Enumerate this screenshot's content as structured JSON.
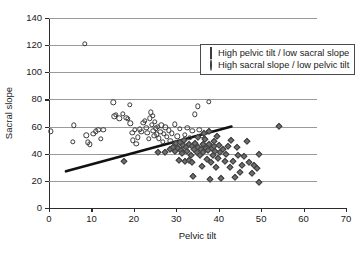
{
  "chart_data": {
    "type": "scatter",
    "title": "",
    "xlabel": "Pelvic tilt",
    "ylabel": "Sacral slope",
    "xlim": [
      0,
      70
    ],
    "ylim": [
      0,
      140
    ],
    "xticks": [
      0,
      10,
      20,
      30,
      40,
      50,
      60,
      70
    ],
    "yticks": [
      0,
      20,
      40,
      60,
      80,
      100,
      120,
      140
    ],
    "grid": "horizontal",
    "legend_position": "upper-center-right-inside",
    "series": [
      {
        "name": "High pelvic tilt / low sacral slope",
        "marker": "filled-diamond",
        "color": "#6e6e6e",
        "points": [
          [
            17.6,
            34.8
          ],
          [
            25.8,
            41.2
          ],
          [
            27.4,
            41.0
          ],
          [
            28.6,
            43.6
          ],
          [
            29.2,
            45.0
          ],
          [
            29.6,
            41.8
          ],
          [
            30.0,
            47.8
          ],
          [
            30.3,
            44.2
          ],
          [
            30.6,
            35.6
          ],
          [
            30.9,
            48.6
          ],
          [
            31.2,
            43.0
          ],
          [
            31.4,
            40.6
          ],
          [
            31.6,
            46.4
          ],
          [
            31.8,
            50.4
          ],
          [
            32.0,
            34.6
          ],
          [
            32.3,
            44.8
          ],
          [
            32.6,
            42.2
          ],
          [
            32.9,
            47.0
          ],
          [
            33.1,
            35.2
          ],
          [
            33.4,
            39.4
          ],
          [
            33.6,
            45.6
          ],
          [
            33.8,
            34.2
          ],
          [
            34.0,
            23.6
          ],
          [
            34.2,
            43.4
          ],
          [
            34.5,
            48.0
          ],
          [
            34.8,
            41.6
          ],
          [
            35.0,
            52.2
          ],
          [
            35.2,
            45.2
          ],
          [
            35.5,
            38.8
          ],
          [
            35.8,
            43.8
          ],
          [
            36.0,
            30.8
          ],
          [
            36.2,
            46.8
          ],
          [
            36.4,
            41.0
          ],
          [
            36.6,
            55.6
          ],
          [
            36.8,
            50.8
          ],
          [
            37.0,
            44.4
          ],
          [
            37.2,
            36.2
          ],
          [
            37.4,
            42.6
          ],
          [
            37.6,
            56.4
          ],
          [
            37.8,
            47.4
          ],
          [
            38.0,
            21.2
          ],
          [
            38.2,
            34.0
          ],
          [
            38.4,
            44.0
          ],
          [
            38.6,
            39.0
          ],
          [
            38.8,
            49.6
          ],
          [
            39.0,
            45.8
          ],
          [
            39.2,
            42.0
          ],
          [
            39.4,
            30.4
          ],
          [
            39.6,
            53.4
          ],
          [
            39.8,
            36.6
          ],
          [
            40.0,
            46.2
          ],
          [
            40.3,
            41.4
          ],
          [
            40.6,
            22.2
          ],
          [
            41.0,
            43.2
          ],
          [
            41.4,
            34.4
          ],
          [
            41.8,
            39.8
          ],
          [
            42.2,
            45.4
          ],
          [
            42.6,
            30.2
          ],
          [
            43.0,
            50.2
          ],
          [
            43.4,
            35.0
          ],
          [
            43.8,
            22.8
          ],
          [
            44.2,
            44.6
          ],
          [
            44.6,
            39.2
          ],
          [
            45.0,
            26.4
          ],
          [
            45.4,
            31.6
          ],
          [
            46.0,
            38.6
          ],
          [
            46.6,
            49.2
          ],
          [
            47.2,
            33.8
          ],
          [
            47.8,
            25.6
          ],
          [
            48.4,
            31.8
          ],
          [
            49.0,
            29.2
          ],
          [
            49.4,
            39.8
          ],
          [
            49.6,
            18.8
          ],
          [
            54.2,
            60.2
          ]
        ]
      },
      {
        "name": "High sacral slope / low pelvic tilt",
        "marker": "open-circle",
        "color": "#3a3a3a",
        "points": [
          [
            0.4,
            56.6
          ],
          [
            5.6,
            49.0
          ],
          [
            5.8,
            60.8
          ],
          [
            8.4,
            121.2
          ],
          [
            8.8,
            53.6
          ],
          [
            9.2,
            48.4
          ],
          [
            9.6,
            47.0
          ],
          [
            10.4,
            54.6
          ],
          [
            11.0,
            56.6
          ],
          [
            11.6,
            57.8
          ],
          [
            12.2,
            51.2
          ],
          [
            12.8,
            57.6
          ],
          [
            15.2,
            78.0
          ],
          [
            15.4,
            67.6
          ],
          [
            15.8,
            68.8
          ],
          [
            16.6,
            66.2
          ],
          [
            17.4,
            69.4
          ],
          [
            18.2,
            66.4
          ],
          [
            18.6,
            65.8
          ],
          [
            19.0,
            76.2
          ],
          [
            19.2,
            62.4
          ],
          [
            19.6,
            55.4
          ],
          [
            19.8,
            50.0
          ],
          [
            20.2,
            57.4
          ],
          [
            20.6,
            47.4
          ],
          [
            21.0,
            52.0
          ],
          [
            21.4,
            58.0
          ],
          [
            21.8,
            56.0
          ],
          [
            22.2,
            62.8
          ],
          [
            22.6,
            64.2
          ],
          [
            22.9,
            59.0
          ],
          [
            23.2,
            55.2
          ],
          [
            23.5,
            50.8
          ],
          [
            23.8,
            66.0
          ],
          [
            24.0,
            70.4
          ],
          [
            24.2,
            61.4
          ],
          [
            24.4,
            67.8
          ],
          [
            24.6,
            57.0
          ],
          [
            24.8,
            53.0
          ],
          [
            25.0,
            63.4
          ],
          [
            25.2,
            58.6
          ],
          [
            25.4,
            54.2
          ],
          [
            25.6,
            60.0
          ],
          [
            25.9,
            51.4
          ],
          [
            26.2,
            56.2
          ],
          [
            26.5,
            61.0
          ],
          [
            26.8,
            48.8
          ],
          [
            27.0,
            54.8
          ],
          [
            27.4,
            59.6
          ],
          [
            27.8,
            52.4
          ],
          [
            28.2,
            57.2
          ],
          [
            28.6,
            49.4
          ],
          [
            29.0,
            55.0
          ],
          [
            29.6,
            61.6
          ],
          [
            30.2,
            52.8
          ],
          [
            30.8,
            58.2
          ],
          [
            31.4,
            47.8
          ],
          [
            32.0,
            54.0
          ],
          [
            32.6,
            59.2
          ],
          [
            33.2,
            51.6
          ],
          [
            33.8,
            56.8
          ],
          [
            34.4,
            69.0
          ],
          [
            35.0,
            75.0
          ],
          [
            35.4,
            57.8
          ],
          [
            36.0,
            53.2
          ],
          [
            37.6,
            78.4
          ]
        ]
      }
    ],
    "trendline": {
      "x0": 4.0,
      "y0": 27.0,
      "x1": 43.0,
      "y1": 60.0,
      "color": "#111111",
      "width": 2.6
    }
  }
}
